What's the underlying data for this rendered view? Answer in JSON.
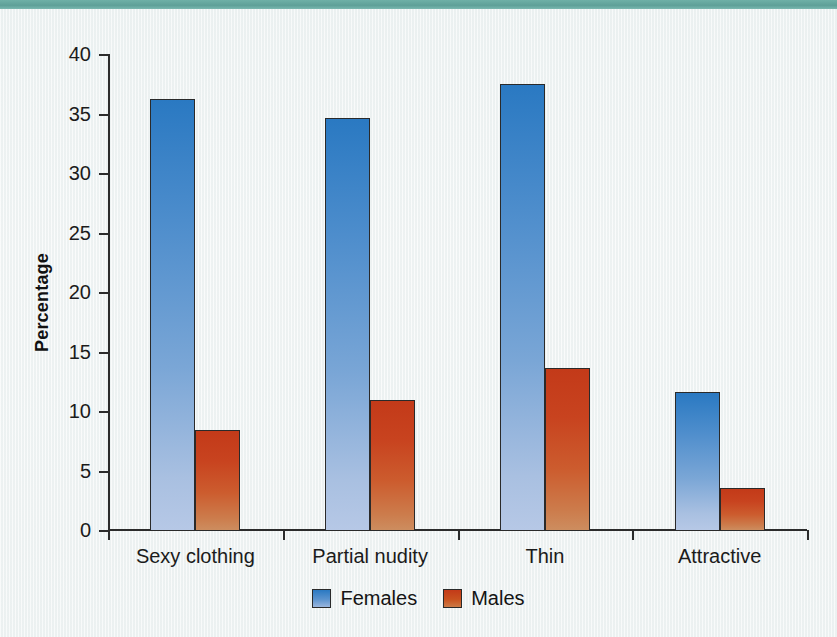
{
  "figure": {
    "background_color": "#f1f5f5",
    "top_band_color": "#64a9a0",
    "axis_color": "#2b2b2b"
  },
  "chart_data": {
    "type": "bar",
    "title": "",
    "xlabel": "",
    "ylabel": "Percentage",
    "ylim": [
      0,
      40
    ],
    "yticks": [
      0,
      5,
      10,
      15,
      20,
      25,
      30,
      35,
      40
    ],
    "ytick_labels": [
      "0",
      "5",
      "10",
      "15",
      "20",
      "25",
      "30",
      "35",
      "40"
    ],
    "grid": false,
    "legend_position": "bottom-center",
    "categories": [
      "Sexy clothing",
      "Partial nudity",
      "Thin",
      "Attractive"
    ],
    "series": [
      {
        "name": "Females",
        "color": "#3179bf",
        "color_top": "#2a79c2",
        "color_bottom": "#b6c8e6",
        "values": [
          36.2,
          34.6,
          37.5,
          11.6
        ]
      },
      {
        "name": "Males",
        "color": "#c33a19",
        "color_top": "#c33a19",
        "color_bottom": "#cd8d5f",
        "values": [
          8.4,
          10.9,
          13.6,
          3.5
        ]
      }
    ]
  },
  "legend": {
    "items": [
      {
        "label": "Females",
        "swatch": "females"
      },
      {
        "label": "Males",
        "swatch": "males"
      }
    ]
  }
}
